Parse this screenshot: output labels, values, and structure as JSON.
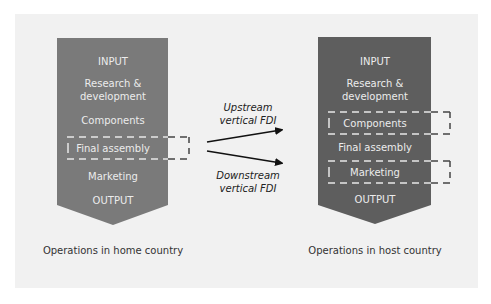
{
  "home": {
    "caption": "Operations in home country",
    "fill": "#7a7a7a",
    "stages": [
      "INPUT",
      "Research &",
      "development",
      "Components",
      "Final assembly",
      "Marketing",
      "OUTPUT"
    ],
    "highlighted": "Final assembly"
  },
  "host": {
    "caption": "Operations in host country",
    "fill": "#5e5e5e",
    "stages": [
      "INPUT",
      "Research &",
      "development",
      "Components",
      "Final assembly",
      "Marketing",
      "OUTPUT"
    ],
    "highlighted": [
      "Components",
      "Marketing"
    ]
  },
  "arrows": {
    "upstream": {
      "line1": "Upstream",
      "line2": "vertical FDI"
    },
    "downstream": {
      "line1": "Downstream",
      "line2": "vertical FDI"
    }
  },
  "colors": {
    "panel": "#f1f1f1",
    "text_on_shape": "#e8e8e8",
    "dash_dark": "#444444",
    "dash_light": "#e6e6e6",
    "caption": "#333333"
  }
}
